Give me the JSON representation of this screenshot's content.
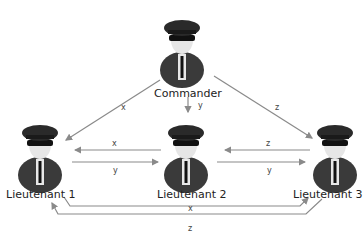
{
  "nodes": {
    "commander": {
      "label": "Commander"
    },
    "lt1": {
      "label": "Lieutenant 1"
    },
    "lt2": {
      "label": "Lieutenant 2"
    },
    "lt3": {
      "label": "Lieutenant 3"
    }
  },
  "edges": {
    "c_lt1": "x",
    "c_lt2": "y",
    "c_lt3": "z",
    "lt2_lt1": "x",
    "lt1_lt2": "y",
    "lt3_lt2": "z",
    "lt2_lt3": "y",
    "lt1_lt3": "x",
    "lt3_lt1": "z"
  },
  "colors": {
    "arrow": "#8a8a8a",
    "figure": "#3a3a3a"
  }
}
